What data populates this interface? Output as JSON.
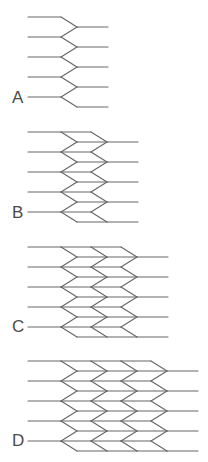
{
  "figure": {
    "line_color": "#666666",
    "label_color": "#4a4a4a",
    "row_spacing": 20,
    "row_offset": 10,
    "rows": 5,
    "left_start_x": 28,
    "column_pitch": 30,
    "first_left_vertex_x": 61,
    "first_right_vertex_x": 77,
    "right_tail_length": 31
  },
  "panels": [
    {
      "label": "A",
      "columns": 1,
      "top_y": 17,
      "label_x": 12,
      "label_y": 89
    },
    {
      "label": "B",
      "columns": 2,
      "top_y": 132,
      "label_x": 12,
      "label_y": 204
    },
    {
      "label": "C",
      "columns": 3,
      "top_y": 247,
      "label_x": 12,
      "label_y": 318
    },
    {
      "label": "D",
      "columns": 4,
      "top_y": 361,
      "label_x": 12,
      "label_y": 432
    }
  ]
}
